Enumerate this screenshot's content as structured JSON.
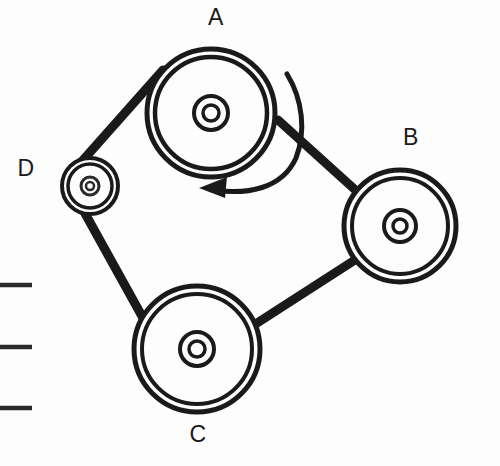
{
  "diagram": {
    "background_color": "#fdfdfd",
    "stroke_color": "#1a1a1a",
    "labels": {
      "a": "A",
      "b": "B",
      "c": "C",
      "d": "D"
    },
    "pulleys": [
      {
        "id": "A",
        "label": "A",
        "cx": 211,
        "cy": 113,
        "outer_r": 64,
        "inner_r": 56,
        "hub_outer_r": 17,
        "hub_inner_r": 8
      },
      {
        "id": "B",
        "label": "B",
        "cx": 400,
        "cy": 226,
        "outer_r": 56,
        "inner_r": 48,
        "hub_outer_r": 16,
        "hub_inner_r": 7
      },
      {
        "id": "C",
        "label": "C",
        "cx": 197,
        "cy": 349,
        "outer_r": 63,
        "inner_r": 55,
        "hub_outer_r": 17,
        "hub_inner_r": 8
      },
      {
        "id": "D",
        "label": "D",
        "cx": 90,
        "cy": 186,
        "outer_r": 28,
        "inner_r": 22,
        "hub_outer_r": 9,
        "hub_inner_r": 4
      }
    ],
    "rotation_arrow": {
      "direction": "counterclockwise",
      "around_pulley": "A",
      "head_x": 207,
      "head_y": 189
    },
    "tick_marks": [
      {
        "x1": 0,
        "x2": 32,
        "y": 285
      },
      {
        "x1": 0,
        "x2": 32,
        "y": 347
      },
      {
        "x1": 0,
        "x2": 32,
        "y": 408
      }
    ]
  }
}
